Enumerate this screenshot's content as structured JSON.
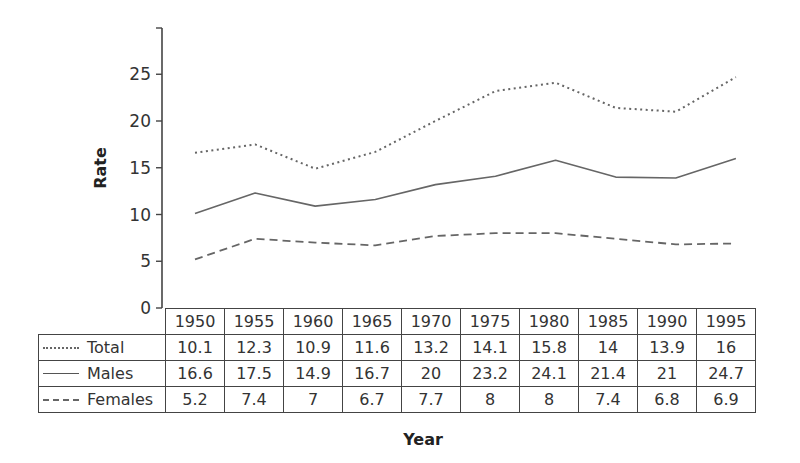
{
  "chart_data": {
    "type": "line",
    "title": "",
    "xlabel": "Year",
    "ylabel": "Rate",
    "ylim": [
      0,
      30
    ],
    "yticks": [
      0,
      5,
      10,
      15,
      20,
      25
    ],
    "grid": false,
    "legend_position": "table-left",
    "categories": [
      "1950",
      "1955",
      "1960",
      "1965",
      "1970",
      "1975",
      "1980",
      "1985",
      "1990",
      "1995"
    ],
    "series": [
      {
        "name": "Total",
        "style": "dotted",
        "values": [
          10.1,
          12.3,
          10.9,
          11.6,
          13.2,
          14.1,
          15.8,
          14,
          13.9,
          16
        ]
      },
      {
        "name": "Males",
        "style": "solid",
        "values": [
          16.6,
          17.5,
          14.9,
          16.7,
          20,
          23.2,
          24.1,
          21.4,
          21,
          24.7
        ]
      },
      {
        "name": "Females",
        "style": "dashed",
        "values": [
          5.2,
          7.4,
          7,
          6.7,
          7.7,
          8,
          8,
          7.4,
          6.8,
          6.9
        ]
      }
    ],
    "plotted_lines_note": "dotted line follows Males values, solid line follows Total values, dashed follows Females"
  },
  "axes": {
    "y_title": "Rate",
    "x_title": "Year",
    "y_tick_labels": [
      "0",
      "5",
      "10",
      "15",
      "20",
      "25"
    ]
  },
  "table": {
    "years": [
      "1950",
      "1955",
      "1960",
      "1965",
      "1970",
      "1975",
      "1980",
      "1985",
      "1990",
      "1995"
    ],
    "rows": [
      {
        "label": "Total",
        "swatch": "dotted",
        "cells": [
          "10.1",
          "12.3",
          "10.9",
          "11.6",
          "13.2",
          "14.1",
          "15.8",
          "14",
          "13.9",
          "16"
        ]
      },
      {
        "label": "Males",
        "swatch": "solid",
        "cells": [
          "16.6",
          "17.5",
          "14.9",
          "16.7",
          "20",
          "23.2",
          "24.1",
          "21.4",
          "21",
          "24.7"
        ]
      },
      {
        "label": "Females",
        "swatch": "dashed",
        "cells": [
          "5.2",
          "7.4",
          "7",
          "6.7",
          "7.7",
          "8",
          "8",
          "7.4",
          "6.8",
          "6.9"
        ]
      }
    ]
  },
  "colors": {
    "line": "#666666",
    "axis": "#444444",
    "text": "#333333"
  }
}
